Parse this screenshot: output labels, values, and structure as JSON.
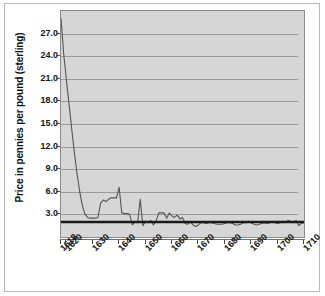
{
  "chart_data": {
    "type": "line",
    "title": "",
    "xlabel": "",
    "ylabel": "Price in pennies per pound (sterling)",
    "xlim": [
      1618,
      1710
    ],
    "ylim": [
      0,
      30
    ],
    "yticks": [
      3.0,
      6.0,
      9.0,
      12.0,
      15.0,
      18.0,
      21.0,
      24.0,
      27.0
    ],
    "ytick_labels": [
      "3.0",
      "6.0",
      "9.0",
      "12.0",
      "15.0",
      "18.0",
      "21.0",
      "24.0",
      "27.0"
    ],
    "xticks": [
      1618,
      1620,
      1630,
      1640,
      1650,
      1660,
      1670,
      1680,
      1690,
      1700,
      1710
    ],
    "xtick_labels": [
      "1618",
      "1620",
      "1630",
      "1640",
      "1650",
      "1660",
      "1670",
      "1680",
      "1690",
      "1700",
      "1710"
    ],
    "grid": true,
    "legend": "none",
    "reference_line": {
      "name": "baseline-rule",
      "value": 2.0,
      "color": "#1a1a1a",
      "width": 2.4,
      "x_start": 1618,
      "x_end": 1710
    },
    "series": [
      {
        "name": "Price in pennies per pound (sterling)",
        "color": "#555555",
        "x": [
          1618,
          1619,
          1620,
          1621,
          1622,
          1623,
          1624,
          1625,
          1626,
          1627,
          1628,
          1629,
          1630,
          1631,
          1632,
          1633,
          1634,
          1635,
          1636,
          1637,
          1638,
          1639,
          1640,
          1641,
          1642,
          1643,
          1644,
          1645,
          1646,
          1647,
          1648,
          1649,
          1650,
          1651,
          1652,
          1653,
          1654,
          1655,
          1656,
          1657,
          1658,
          1659,
          1660,
          1661,
          1662,
          1663,
          1664,
          1665,
          1666,
          1667,
          1668,
          1669,
          1670,
          1671,
          1672,
          1673,
          1674,
          1675,
          1676,
          1677,
          1678,
          1679,
          1680,
          1681,
          1682,
          1683,
          1684,
          1685,
          1686,
          1687,
          1688,
          1689,
          1690,
          1691,
          1692,
          1693,
          1694,
          1695,
          1696,
          1697,
          1698,
          1699,
          1700,
          1701,
          1702,
          1703,
          1704,
          1705,
          1706,
          1707,
          1708,
          1709,
          1710
        ],
        "y": [
          29.0,
          24.4,
          21.0,
          17.8,
          14.5,
          11.4,
          8.6,
          6.2,
          4.3,
          3.1,
          2.6,
          2.5,
          2.5,
          2.5,
          2.6,
          4.5,
          4.9,
          4.7,
          5.0,
          5.2,
          5.2,
          5.2,
          6.6,
          3.2,
          3.1,
          3.1,
          3.0,
          1.6,
          2.0,
          1.9,
          5.0,
          1.5,
          2.1,
          1.9,
          2.2,
          1.6,
          2.1,
          3.2,
          3.2,
          3.2,
          2.5,
          3.2,
          2.8,
          2.6,
          2.9,
          2.4,
          2.6,
          1.8,
          1.7,
          2.0,
          1.6,
          1.4,
          1.6,
          1.9,
          1.9,
          1.8,
          1.9,
          1.9,
          1.8,
          1.7,
          1.7,
          1.7,
          1.8,
          1.9,
          1.9,
          1.8,
          1.6,
          1.6,
          1.7,
          1.9,
          1.9,
          2.1,
          1.9,
          1.7,
          1.6,
          1.7,
          1.8,
          1.9,
          1.8,
          1.9,
          2.0,
          1.9,
          1.8,
          1.9,
          2.1,
          2.0,
          2.2,
          2.1,
          1.9,
          2.2,
          1.5,
          1.8,
          1.9
        ]
      }
    ]
  },
  "axes": {
    "y_title": "Price in pennies per pound (sterling)"
  }
}
